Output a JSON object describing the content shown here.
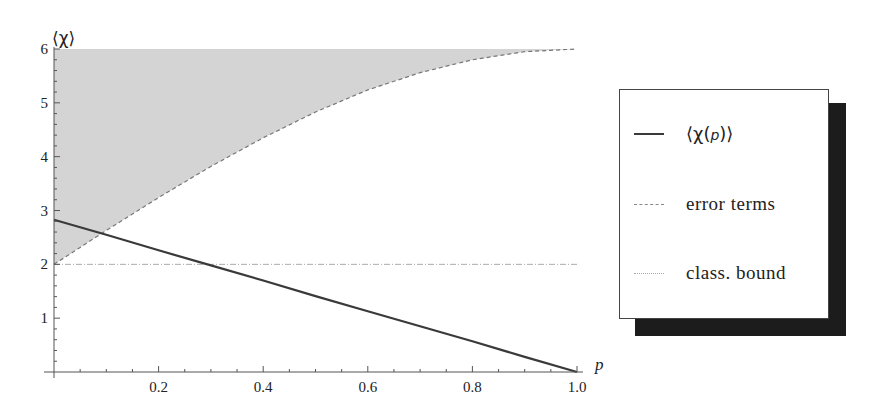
{
  "chart_data": {
    "type": "line",
    "title": "",
    "xlabel": "p",
    "ylabel": "⟨χ⟩",
    "xlim": [
      0,
      1.0
    ],
    "ylim": [
      0,
      6
    ],
    "x_ticks": [
      "0.2",
      "0.4",
      "0.6",
      "0.8",
      "1.0"
    ],
    "y_ticks": [
      "1",
      "2",
      "3",
      "4",
      "5",
      "6"
    ],
    "grid": false,
    "legend_position": "right",
    "x": [
      0.0,
      0.1,
      0.2,
      0.3,
      0.4,
      0.5,
      0.6,
      0.7,
      0.8,
      0.9,
      1.0
    ],
    "series": [
      {
        "name": "⟨χ(p)⟩",
        "style": "solid",
        "values": [
          2.83,
          2.55,
          2.26,
          1.98,
          1.7,
          1.41,
          1.13,
          0.85,
          0.57,
          0.28,
          0.0
        ]
      },
      {
        "name": "error terms",
        "style": "dashed",
        "values": [
          2.0,
          2.63,
          3.24,
          3.82,
          4.35,
          4.83,
          5.24,
          5.56,
          5.8,
          5.95,
          6.0
        ]
      },
      {
        "name": "class. bound",
        "style": "dotted",
        "values": [
          2,
          2,
          2,
          2,
          2,
          2,
          2,
          2,
          2,
          2,
          2
        ]
      }
    ],
    "shaded_region": {
      "description": "area between error terms curve and y=6",
      "color": "#d4d4d4"
    }
  },
  "legend": {
    "items": [
      {
        "label_prefix": "⟨χ(",
        "label_var": "p",
        "label_suffix": ")⟩",
        "style": "solid"
      },
      {
        "label": "error terms",
        "style": "dashed"
      },
      {
        "label": "class. bound",
        "style": "dotted"
      }
    ]
  },
  "colors": {
    "line": "#3a3a3a",
    "shade": "#d4d4d4",
    "dashed": "#777777",
    "dotted": "#aaaaaa",
    "shadow": "#1c1c1c"
  }
}
